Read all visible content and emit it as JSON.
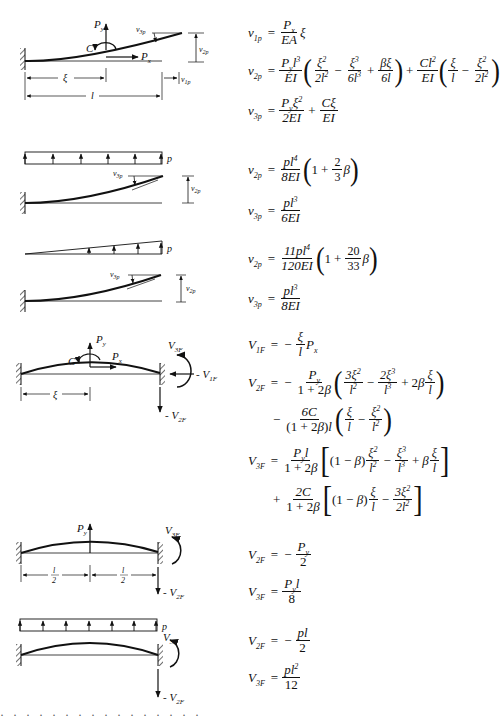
{
  "cases": [
    {
      "id": "concentrated-load-cantilever",
      "diagram_labels": {
        "py": "P",
        "py_sub": "y",
        "px": "P",
        "px_sub": "x",
        "c": "C",
        "v3p": "v",
        "v3p_sub": "3p",
        "v2p": "v",
        "v2p_sub": "2p",
        "v1p": "v",
        "v1p_sub": "1p",
        "xi": "ξ",
        "l": "l"
      },
      "equations": [
        {
          "lhs": "v",
          "lhs_sub": "1p",
          "expr": "= P_x/(EA) ξ",
          "num": "P",
          "num_sub": "x",
          "den": "EA",
          "tail": "ξ"
        },
        {
          "lhs": "v",
          "lhs_sub": "2p",
          "expr": "= P_y l³/(EI) (ξ²/(2l²) − ξ³/(6l³) + βξ/(6l)) + Cl²/(EI) (ξ/l − ξ²/(2l²))"
        },
        {
          "lhs": "v",
          "lhs_sub": "3p",
          "expr": "= P_y ξ²/(2EI) + Cξ/(EI)"
        }
      ]
    },
    {
      "id": "uniform-load-cantilever",
      "diagram_labels": {
        "p": "p",
        "v3p": "v",
        "v3p_sub": "3p",
        "v2p": "v",
        "v2p_sub": "2p"
      },
      "equations": [
        {
          "lhs": "v",
          "lhs_sub": "2p",
          "expr": "= pl⁴/(8EI) (1 + 2/3 β)"
        },
        {
          "lhs": "v",
          "lhs_sub": "3p",
          "expr": "= pl³/(6EI)"
        }
      ]
    },
    {
      "id": "triangular-load-cantilever",
      "diagram_labels": {
        "p": "p",
        "v3p": "v",
        "v3p_sub": "3p",
        "v2p": "v",
        "v2p_sub": "2p"
      },
      "equations": [
        {
          "lhs": "v",
          "lhs_sub": "2p",
          "expr": "= 11pl⁴/(120EI) (1 + 20/33 β)"
        },
        {
          "lhs": "v",
          "lhs_sub": "3p",
          "expr": "= pl³/(8EI)"
        }
      ]
    },
    {
      "id": "concentrated-load-fixed-fixed",
      "diagram_labels": {
        "py": "P",
        "py_sub": "y",
        "px": "P",
        "px_sub": "x",
        "c": "C",
        "v3f": "V",
        "v3f_sub": "3F",
        "v1f": "- V",
        "v1f_sub": "1F",
        "v2f": "- V",
        "v2f_sub": "2F",
        "xi": "ξ"
      },
      "equations": [
        {
          "lhs": "V",
          "lhs_sub": "1F",
          "expr": "= − ξ/l P_x"
        },
        {
          "lhs": "V",
          "lhs_sub": "2F",
          "expr": "= − P_y/(1+2β) (3ξ²/l² − 2ξ³/l³ + 2β ξ/l) − 6C/((1+2β)l) (ξ/l − ξ²/l²)"
        },
        {
          "lhs": "V",
          "lhs_sub": "3F",
          "expr": "= P_y l/(1+2β) [(1−β) ξ²/l² − ξ³/l³ + β ξ/l] + 2C/(1+2β) [(1−β) ξ/l − 3ξ²/(2l²)]"
        }
      ]
    },
    {
      "id": "midspan-load-fixed-fixed",
      "diagram_labels": {
        "py": "P",
        "py_sub": "y",
        "v3f": "V",
        "v3f_sub": "3F",
        "v2f": "- V",
        "v2f_sub": "2F",
        "half_l_num": "l",
        "half_l_den": "2"
      },
      "equations": [
        {
          "lhs": "V",
          "lhs_sub": "2F",
          "expr": "= − P_y/2"
        },
        {
          "lhs": "V",
          "lhs_sub": "3F",
          "expr": "= P_y l/8"
        }
      ]
    },
    {
      "id": "uniform-load-fixed-fixed",
      "diagram_labels": {
        "p": "p",
        "v3f": "V",
        "v3f_sub": "3F",
        "v2f": "- V",
        "v2f_sub": "2F"
      },
      "equations": [
        {
          "lhs": "V",
          "lhs_sub": "2F",
          "expr": "= − pl/2"
        },
        {
          "lhs": "V",
          "lhs_sub": "3F",
          "expr": "= pl²/12"
        }
      ]
    }
  ],
  "symbols": {
    "eq": "=",
    "minus": "−",
    "plus": "+",
    "P": "P",
    "y": "y",
    "x": "x",
    "EA": "EA",
    "EI": "EI",
    "xi": "ξ",
    "beta": "β",
    "C": "C",
    "l": "l",
    "p": "p",
    "two": "2",
    "three": "3",
    "six": "6",
    "eight": "8",
    "twelve": "12",
    "one_plus_2b": "1 + 2β",
    "one_minus_b": "(1 − β)",
    "one": "1"
  },
  "footer_cutoff": "· · · · · · · · · · · · · · · ·"
}
